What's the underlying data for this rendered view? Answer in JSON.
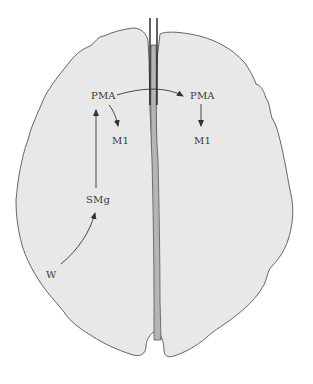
{
  "diagram": {
    "title": "",
    "colors": {
      "background": "#ffffff",
      "hemisphere_fill": "#e8e8e8",
      "outline": "#555555",
      "corpus_callosum_fill": "#b5b5b5",
      "arrow": "#333333",
      "label": "#3a3a3a"
    },
    "left_hemisphere": {
      "labels": {
        "pma": "PMA",
        "m1": "M1",
        "smg": "SMg",
        "w": "W"
      }
    },
    "right_hemisphere": {
      "labels": {
        "pma": "PMA",
        "m1": "M1"
      }
    },
    "connections": [
      {
        "from": "W",
        "to": "SMg",
        "hemisphere": "left",
        "shape": "curved"
      },
      {
        "from": "SMg",
        "to": "PMA",
        "hemisphere": "left",
        "shape": "straight"
      },
      {
        "from": "PMA",
        "to": "M1",
        "hemisphere": "left",
        "shape": "curved"
      },
      {
        "from": "PMA (left)",
        "to": "PMA (right)",
        "via": "corpus callosum",
        "shape": "curved"
      },
      {
        "from": "PMA",
        "to": "M1",
        "hemisphere": "right",
        "shape": "straight"
      }
    ],
    "lesion_marker": "double vertical lines across anterior corpus callosum"
  }
}
